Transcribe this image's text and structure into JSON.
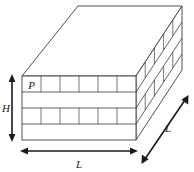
{
  "figure": {
    "name": "layered-block-3d-diagram",
    "background_color": "#ffffff",
    "line_color": "#3c3c3c",
    "arrow_color": "#1a1a1a",
    "face_fill": "#ffffff"
  },
  "labels": {
    "cell_label": "P",
    "height_label": "H",
    "width_label": "L",
    "depth_label": "L"
  },
  "dimension_arrows": [
    {
      "name": "height-arrow",
      "label": "H",
      "orientation": "vertical",
      "double_headed": true
    },
    {
      "name": "width-arrow",
      "label": "L",
      "orientation": "horizontal",
      "double_headed": true
    },
    {
      "name": "depth-arrow",
      "label": "L",
      "orientation": "diagonal",
      "double_headed": true
    }
  ],
  "structure": {
    "front_bands": [
      {
        "index": 1,
        "subdivided": true,
        "cells": 6,
        "first_cell_label": "P"
      },
      {
        "index": 2,
        "subdivided": false,
        "cells": 0,
        "first_cell_label": ""
      },
      {
        "index": 3,
        "subdivided": true,
        "cells": 6,
        "first_cell_label": ""
      },
      {
        "index": 4,
        "subdivided": false,
        "cells": 0,
        "first_cell_label": ""
      }
    ],
    "side_bands": [
      {
        "index": 1,
        "subdivided": true,
        "cells": 5
      },
      {
        "index": 2,
        "subdivided": false,
        "cells": 0
      },
      {
        "index": 3,
        "subdivided": true,
        "cells": 5
      },
      {
        "index": 4,
        "subdivided": false,
        "cells": 0
      }
    ],
    "top_face": {
      "subdivided": false,
      "label": ""
    }
  }
}
